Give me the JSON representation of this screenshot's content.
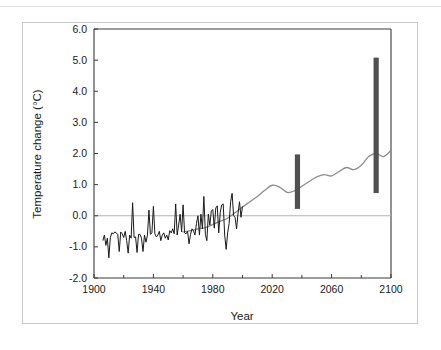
{
  "chart_data": {
    "type": "line",
    "title": "",
    "xlabel": "Year",
    "ylabel": "Temperature change (°C)",
    "xlim": [
      1900,
      2100
    ],
    "ylim": [
      -2.0,
      6.0
    ],
    "grid": false,
    "legend": "none",
    "x_ticks": [
      1900,
      1940,
      1980,
      2020,
      2060,
      2100
    ],
    "x_tick_labels": [
      "1900",
      "1940",
      "1980",
      "2020",
      "2060",
      "2100"
    ],
    "x_minor_ticks": [
      1920,
      1960,
      2000,
      2040,
      2080
    ],
    "y_ticks": [
      -2.0,
      -1.0,
      0.0,
      1.0,
      2.0,
      3.0,
      4.0,
      5.0,
      6.0
    ],
    "y_tick_labels": [
      "-2.0",
      "-1.0",
      "0.0",
      "1.0",
      "2.0",
      "3.0",
      "4.0",
      "5.0",
      "6.0"
    ],
    "zero_line": 0.0,
    "series": [
      {
        "name": "Observed temperature change",
        "color": "#1a1a1a",
        "style": "jagged-line",
        "x": [
          1906,
          1907,
          1908,
          1909,
          1910,
          1911,
          1912,
          1913,
          1914,
          1915,
          1916,
          1917,
          1918,
          1919,
          1920,
          1921,
          1922,
          1923,
          1924,
          1925,
          1926,
          1927,
          1928,
          1929,
          1930,
          1931,
          1932,
          1933,
          1934,
          1935,
          1936,
          1937,
          1938,
          1939,
          1940,
          1941,
          1942,
          1943,
          1944,
          1945,
          1946,
          1947,
          1948,
          1949,
          1950,
          1951,
          1952,
          1953,
          1954,
          1955,
          1956,
          1957,
          1958,
          1959,
          1960,
          1961,
          1962,
          1963,
          1964,
          1965,
          1966,
          1967,
          1968,
          1969,
          1970,
          1971,
          1972,
          1973,
          1974,
          1975,
          1976,
          1977,
          1978,
          1979,
          1980,
          1981,
          1982,
          1983,
          1984,
          1985,
          1986,
          1987,
          1988,
          1989,
          1990,
          1991,
          1992,
          1993,
          1994,
          1995,
          1996,
          1997,
          1998,
          1999,
          2000
        ],
        "y": [
          -0.8,
          -0.62,
          -0.95,
          -0.72,
          -1.35,
          -0.7,
          -0.55,
          -0.58,
          -0.52,
          -0.55,
          -0.6,
          -1.15,
          -0.52,
          -0.58,
          -0.7,
          -0.5,
          -0.8,
          -1.2,
          -0.62,
          -0.72,
          0.42,
          -0.7,
          -0.68,
          -1.18,
          -0.6,
          -0.6,
          -0.72,
          -1.15,
          -0.62,
          -0.85,
          -0.62,
          0.18,
          -0.6,
          -0.55,
          0.3,
          -0.58,
          -0.68,
          -0.62,
          -0.5,
          -0.8,
          -0.62,
          -0.55,
          -0.72,
          -0.62,
          -0.78,
          -0.48,
          -0.55,
          -0.42,
          -0.58,
          0.38,
          -0.62,
          -0.3,
          0.05,
          -0.52,
          0.35,
          -0.55,
          -0.58,
          -0.5,
          -0.9,
          -0.6,
          -0.42,
          -0.48,
          -0.62,
          -0.25,
          0.0,
          -0.62,
          0.05,
          -0.42,
          0.62,
          -0.6,
          -0.8,
          0.05,
          -0.3,
          0.15,
          0.2,
          -0.4,
          0.25,
          0.32,
          -0.55,
          0.1,
          0.35,
          0.38,
          -0.62,
          -1.08,
          -0.55,
          -0.25,
          0.45,
          0.72,
          0.0,
          -0.05,
          -0.42,
          0.08,
          0.45,
          -0.05,
          0.3
        ]
      },
      {
        "name": "Projected temperature change",
        "color": "#8c8c8c",
        "style": "smooth-line",
        "x": [
          1960,
          1965,
          1970,
          1975,
          1980,
          1985,
          1990,
          1995,
          2000,
          2005,
          2010,
          2015,
          2020,
          2025,
          2030,
          2035,
          2040,
          2045,
          2050,
          2055,
          2060,
          2065,
          2070,
          2075,
          2080,
          2085,
          2090,
          2095,
          2100
        ],
        "y": [
          -0.52,
          -0.48,
          -0.42,
          -0.38,
          -0.28,
          -0.18,
          -0.08,
          0.1,
          0.28,
          0.45,
          0.62,
          0.82,
          0.98,
          0.92,
          0.75,
          0.8,
          0.95,
          1.1,
          1.25,
          1.32,
          1.28,
          1.42,
          1.55,
          1.48,
          1.62,
          1.9,
          2.0,
          1.9,
          2.1
        ]
      }
    ],
    "range_bars": [
      {
        "name": "uncertainty-range-2040",
        "year": 2037,
        "low": 0.22,
        "high": 1.97,
        "color": "#505050"
      },
      {
        "name": "uncertainty-range-2090",
        "year": 2090,
        "low": 0.73,
        "high": 5.08,
        "color": "#505050"
      }
    ]
  }
}
